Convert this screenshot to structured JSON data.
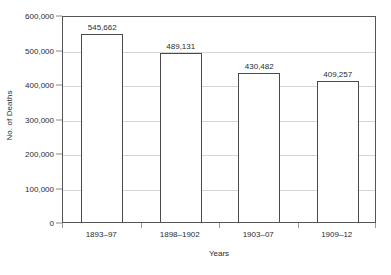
{
  "chart_data": {
    "type": "bar",
    "title": "",
    "xlabel": "Years",
    "ylabel": "No. of Deaths",
    "categories": [
      "1893–97",
      "1898–1902",
      "1903–07",
      "1909–12"
    ],
    "values": [
      545662,
      489131,
      430482,
      409257
    ],
    "value_labels": [
      "545,662",
      "489,131",
      "430,482",
      "409,257"
    ],
    "ylim": [
      0,
      600000
    ],
    "ytick_values": [
      0,
      100000,
      200000,
      300000,
      400000,
      500000,
      600000
    ],
    "ytick_labels": [
      "0",
      "100,000",
      "200,000",
      "300,000",
      "400,000",
      "500,000",
      "600,000"
    ],
    "grid": "horizontal",
    "legend": "none",
    "bar_fill_color": "#ffffff",
    "bar_edge_color": "#4a4a4a",
    "gridline_color": "#d6d6d6",
    "axis_border_color": "#555555",
    "text_color": "#2b2b2b",
    "background_color": "#ffffff"
  }
}
